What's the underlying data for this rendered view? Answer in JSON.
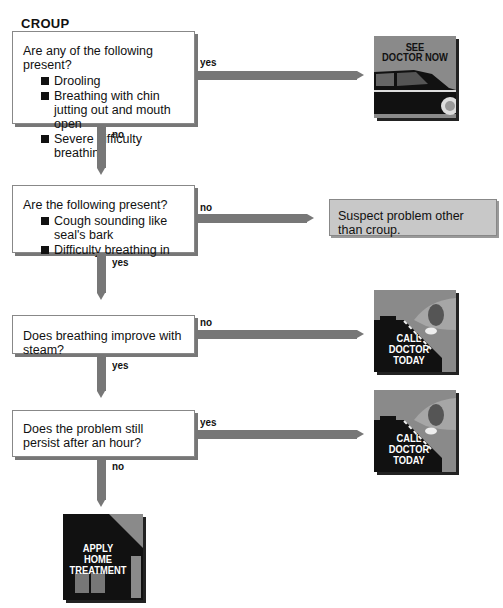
{
  "title": "CROUP",
  "questions": [
    {
      "text": "Are any of the following present?",
      "bullets": [
        "Drooling",
        "Breathing with chin jutting out and mouth open",
        "Severe difficulty breathing"
      ],
      "right_label": "yes",
      "down_label": "no"
    },
    {
      "text": "Are the following present?",
      "bullets": [
        "Cough sounding like seal's bark",
        "Difficulty breathing in"
      ],
      "right_label": "no",
      "down_label": "yes"
    },
    {
      "text": "Does breathing improve with steam?",
      "bullets": [],
      "right_label": "no",
      "down_label": "yes"
    },
    {
      "text": "Does the problem still persist after an hour?",
      "bullets": [],
      "right_label": "yes",
      "down_label": "no"
    }
  ],
  "outcomes": {
    "see_doctor_now": {
      "line1": "SEE",
      "line2": "DOCTOR NOW",
      "icon": "car-icon"
    },
    "other_problem": "Suspect problem other than croup.",
    "call_doctor_today_1": {
      "line1": "CALL",
      "line2": "DOCTOR",
      "line3": "TODAY",
      "icon": "phone-icon"
    },
    "call_doctor_today_2": {
      "line1": "CALL",
      "line2": "DOCTOR",
      "line3": "TODAY",
      "icon": "phone-icon"
    },
    "apply_home_treatment": {
      "line1": "APPLY",
      "line2": "HOME",
      "line3": "TREATMENT",
      "icon": "house-icon"
    }
  },
  "colors": {
    "connector": "#777777",
    "card_bg": "#8a8a8a",
    "card_dark": "#111111",
    "result_bg": "#c8c8c8"
  }
}
